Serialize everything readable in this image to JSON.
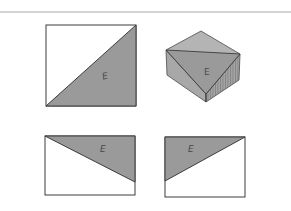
{
  "colors": {
    "background": "#ffffff",
    "rule": "#9a9a9a",
    "outline": "#3c3c3c",
    "fill_gray": "#9a9a9a",
    "face_top": "#b4b4b4",
    "face_left": "#a8a8a8",
    "face_right": "#a0a0a0",
    "hatch": "#6e6e6e"
  },
  "figures": {
    "top_left_square": {
      "label": "E"
    },
    "isometric_block": {
      "label": "E"
    },
    "bottom_left_rect": {
      "label": "E"
    },
    "bottom_right_rect": {
      "label": "E"
    }
  }
}
